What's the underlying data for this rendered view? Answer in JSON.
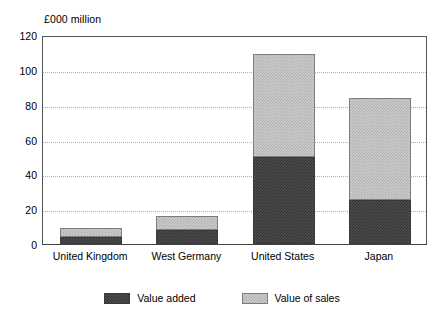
{
  "chart_data": {
    "type": "bar",
    "subtype": "stacked",
    "title": "",
    "xlabel": "",
    "ylabel": "£000 million",
    "ylim": [
      0,
      120
    ],
    "yticks": [
      0,
      20,
      40,
      60,
      80,
      100,
      120
    ],
    "ytick_labels": [
      "0",
      "20",
      "40",
      "60",
      "80",
      "100",
      "120"
    ],
    "grid": true,
    "grid_axis": "y",
    "legend_position": "bottom-center",
    "categories": [
      "United Kingdom",
      "West Germany",
      "United States",
      "Japan"
    ],
    "series": [
      {
        "name": "Value added",
        "color": "#4d4d4d",
        "values": [
          4,
          8,
          50,
          25
        ]
      },
      {
        "name": "Value of sales",
        "color": "#cdcdcd",
        "values": [
          5,
          8,
          59,
          59
        ]
      }
    ],
    "totals": [
      9,
      16,
      109,
      84
    ]
  },
  "axis": {
    "unit_label": "£000 million"
  },
  "legend": {
    "items": [
      {
        "label": "Value added",
        "swatch": "dark-hatch-swatch"
      },
      {
        "label": "Value of sales",
        "swatch": "light-hatch-swatch"
      }
    ]
  }
}
